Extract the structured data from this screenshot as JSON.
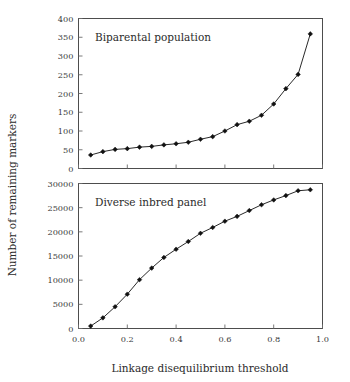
{
  "figure": {
    "ylabel": "Number of remaining markers",
    "xlabel": "Linkage disequilibrium threshold"
  },
  "chart_data": [
    {
      "type": "line",
      "title": "Biparental population",
      "xlabel": "",
      "ylabel": "Number of remaining markers",
      "xlim": [
        0.0,
        1.0
      ],
      "ylim": [
        0,
        400
      ],
      "xticks": [
        "0.0",
        "0.2",
        "0.4",
        "0.6",
        "0.8",
        "1.0"
      ],
      "xtickvalues": [
        0.0,
        0.2,
        0.4,
        0.6,
        0.8,
        1.0
      ],
      "yticks": [
        "0",
        "50",
        "100",
        "150",
        "200",
        "250",
        "300",
        "350",
        "400"
      ],
      "ytickvalues": [
        0,
        50,
        100,
        150,
        200,
        250,
        300,
        350,
        400
      ],
      "grid": false,
      "legend": "none",
      "marker": "diamond",
      "x": [
        0.05,
        0.1,
        0.15,
        0.2,
        0.25,
        0.3,
        0.35,
        0.4,
        0.45,
        0.5,
        0.55,
        0.6,
        0.65,
        0.7,
        0.75,
        0.8,
        0.85,
        0.9,
        0.95
      ],
      "values": [
        36,
        45,
        51,
        53,
        57,
        59,
        63,
        66,
        70,
        78,
        85,
        100,
        117,
        126,
        142,
        172,
        213,
        251,
        359
      ]
    },
    {
      "type": "line",
      "title": "Diverse inbred panel",
      "xlabel": "Linkage disequilibrium threshold",
      "ylabel": "Number of remaining markers",
      "xlim": [
        0.0,
        1.0
      ],
      "ylim": [
        0,
        30000
      ],
      "xticks": [
        "0.0",
        "0.2",
        "0.4",
        "0.6",
        "0.8",
        "1.0"
      ],
      "xtickvalues": [
        0.0,
        0.2,
        0.4,
        0.6,
        0.8,
        1.0
      ],
      "yticks": [
        "0",
        "5000",
        "10000",
        "15000",
        "20000",
        "25000",
        "30000"
      ],
      "ytickvalues": [
        0,
        5000,
        10000,
        15000,
        20000,
        25000,
        30000
      ],
      "grid": false,
      "legend": "none",
      "marker": "diamond",
      "x": [
        0.05,
        0.1,
        0.15,
        0.2,
        0.25,
        0.3,
        0.35,
        0.4,
        0.45,
        0.5,
        0.55,
        0.6,
        0.65,
        0.7,
        0.75,
        0.8,
        0.85,
        0.9,
        0.95
      ],
      "values": [
        500,
        2200,
        4500,
        7100,
        10100,
        12500,
        14700,
        16400,
        18000,
        19700,
        20900,
        22200,
        23200,
        24400,
        25600,
        26600,
        27500,
        28500,
        28700
      ]
    }
  ]
}
